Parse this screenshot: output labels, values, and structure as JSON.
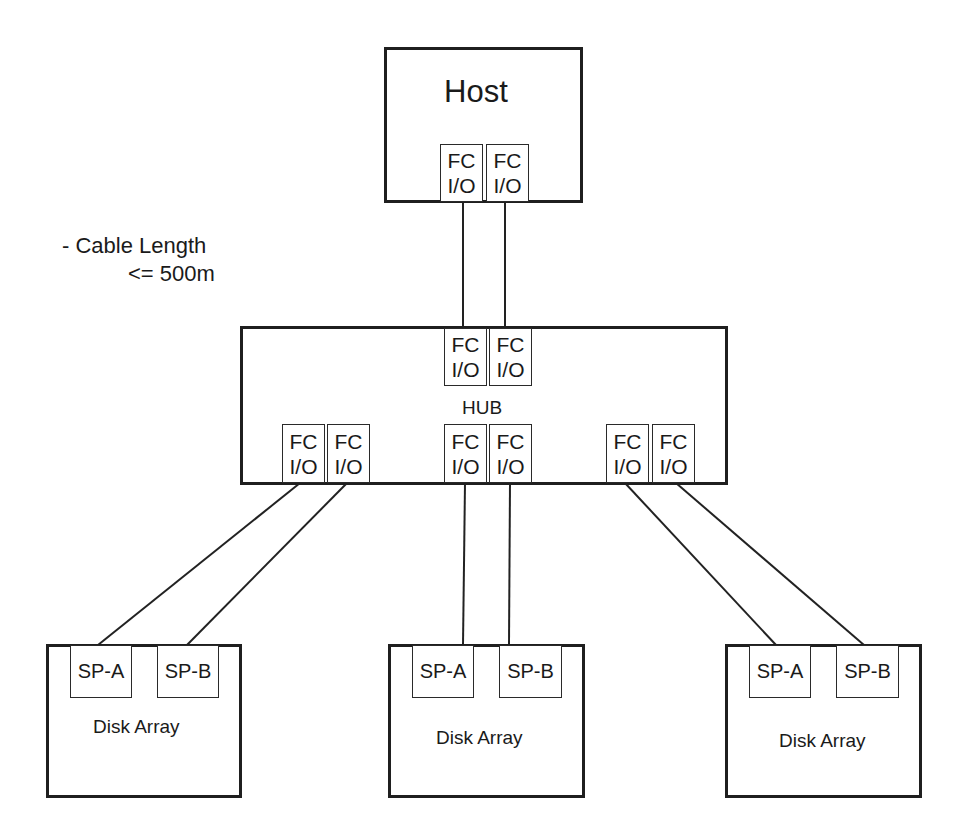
{
  "diagram": {
    "note": {
      "line1": "- Cable Length",
      "line2": "<= 500m"
    },
    "host": {
      "label": "Host",
      "ports": [
        {
          "line1": "FC",
          "line2": "I/O"
        },
        {
          "line1": "FC",
          "line2": "I/O"
        }
      ]
    },
    "hub": {
      "label": "HUB",
      "upstream_ports": [
        {
          "line1": "FC",
          "line2": "I/O"
        },
        {
          "line1": "FC",
          "line2": "I/O"
        }
      ],
      "downstream_ports": [
        {
          "line1": "FC",
          "line2": "I/O"
        },
        {
          "line1": "FC",
          "line2": "I/O"
        },
        {
          "line1": "FC",
          "line2": "I/O"
        },
        {
          "line1": "FC",
          "line2": "I/O"
        },
        {
          "line1": "FC",
          "line2": "I/O"
        },
        {
          "line1": "FC",
          "line2": "I/O"
        }
      ]
    },
    "disk_arrays": [
      {
        "label": "Disk Array",
        "sp_a": "SP-A",
        "sp_b": "SP-B"
      },
      {
        "label": "Disk Array",
        "sp_a": "SP-A",
        "sp_b": "SP-B"
      },
      {
        "label": "Disk Array",
        "sp_a": "SP-A",
        "sp_b": "SP-B"
      }
    ],
    "colors": {
      "stroke": "#1f1f1f",
      "background": "#ffffff"
    }
  }
}
